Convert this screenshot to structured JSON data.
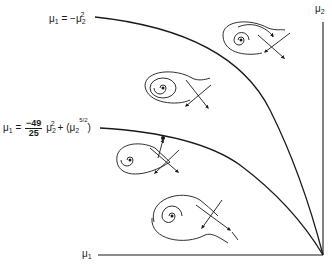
{
  "figure": {
    "type": "bifurcation-diagram",
    "axes": {
      "x_label": {
        "base": "μ",
        "sub": "1"
      },
      "y_label": {
        "base": "μ",
        "sub": "2"
      },
      "origin_position": "bottom-right"
    },
    "curves": [
      {
        "id": "upper-curve",
        "label": {
          "lhs_base": "μ",
          "lhs_sub": "1",
          "eq": "=",
          "rhs_prefix": "−μ",
          "rhs_sub": "2",
          "rhs_sup": "2"
        }
      },
      {
        "id": "lower-curve",
        "label": {
          "lhs_base": "μ",
          "lhs_sub": "1",
          "eq": "=",
          "frac_num": "−49",
          "frac_den": "25",
          "term1_base": "μ",
          "term1_sub": "2",
          "term1_sup": "2",
          "plus": "+",
          "paren_open": "(",
          "term2_base": "μ",
          "term2_sub": "2",
          "term2_sup_num": "5",
          "term2_sup_den": "2",
          "paren_close": ")"
        }
      }
    ],
    "phase_portraits": [
      {
        "region": "top-right-beyond-upper-curve",
        "type": "spiral-with-saddle-loop"
      },
      {
        "region": "between-curves-upper",
        "type": "nested-orbits-with-saddle"
      },
      {
        "region": "on-lower-curve",
        "type": "homoclinic-loop-with-saddle"
      },
      {
        "region": "below-lower-curve",
        "type": "spiral-with-saddle"
      }
    ],
    "marked_point_on_lower_curve": true
  },
  "colors": {
    "ink": "#1a1a1a",
    "background": "#ffffff"
  }
}
